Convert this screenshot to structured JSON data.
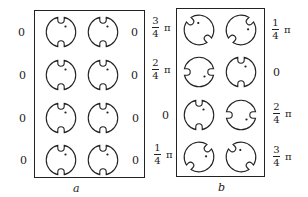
{
  "panels": {
    "a": {
      "caption": "a",
      "left_labels": [
        "0",
        "0",
        "0",
        "0"
      ],
      "right_labels": [
        "0",
        "0",
        "0",
        "0"
      ],
      "cells": [
        {
          "row": 1,
          "col": 1,
          "notch_angle_deg": 0
        },
        {
          "row": 1,
          "col": 2,
          "notch_angle_deg": 0
        },
        {
          "row": 2,
          "col": 1,
          "notch_angle_deg": 0
        },
        {
          "row": 2,
          "col": 2,
          "notch_angle_deg": 0
        },
        {
          "row": 3,
          "col": 1,
          "notch_angle_deg": 0
        },
        {
          "row": 3,
          "col": 2,
          "notch_angle_deg": 0
        },
        {
          "row": 4,
          "col": 1,
          "notch_angle_deg": 0
        },
        {
          "row": 4,
          "col": 2,
          "notch_angle_deg": 0
        }
      ]
    },
    "b": {
      "caption": "b",
      "left_labels": [
        {
          "num": "3",
          "den": "4",
          "pi": "π"
        },
        {
          "num": "2",
          "den": "4",
          "pi": "π"
        },
        {
          "value": "0"
        },
        {
          "num": "1",
          "den": "4",
          "pi": "π"
        }
      ],
      "right_labels": [
        {
          "num": "1",
          "den": "4",
          "pi": "π"
        },
        {
          "value": "0"
        },
        {
          "num": "2",
          "den": "4",
          "pi": "π"
        },
        {
          "num": "3",
          "den": "4",
          "pi": "π"
        }
      ],
      "cells": [
        {
          "row": 1,
          "col": 1,
          "phase": "3/4 π",
          "notch_angle_deg": -45
        },
        {
          "row": 1,
          "col": 2,
          "phase": "1/4 π",
          "notch_angle_deg": 45
        },
        {
          "row": 2,
          "col": 1,
          "phase": "2/4 π",
          "notch_angle_deg": 90
        },
        {
          "row": 2,
          "col": 2,
          "phase": "0",
          "notch_angle_deg": 0
        },
        {
          "row": 3,
          "col": 1,
          "phase": "0",
          "notch_angle_deg": 0
        },
        {
          "row": 3,
          "col": 2,
          "phase": "2/4 π",
          "notch_angle_deg": 90
        },
        {
          "row": 4,
          "col": 1,
          "phase": "1/4 π",
          "notch_angle_deg": 45
        },
        {
          "row": 4,
          "col": 2,
          "phase": "3/4 π",
          "notch_angle_deg": -45
        }
      ]
    }
  },
  "colors": {
    "ink": "#222222",
    "background": "#ffffff"
  }
}
